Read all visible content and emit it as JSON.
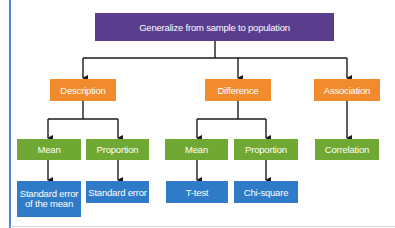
{
  "diagram": {
    "colors": {
      "root": "#5a3d8c",
      "category": "#f28a2e",
      "parameter": "#6fa832",
      "method": "#2f7bc8",
      "connector": "#1a1a1a",
      "frame_rule": "#4a86c8"
    },
    "root": {
      "label": "Generalize from sample to population"
    },
    "categories": [
      {
        "label": "Description",
        "children": [
          {
            "label": "Mean",
            "method": "Standard error of the mean"
          },
          {
            "label": "Proportion",
            "method": "Standard error"
          }
        ]
      },
      {
        "label": "Difference",
        "children": [
          {
            "label": "Mean",
            "method": "T-test"
          },
          {
            "label": "Proportion",
            "method": "Chi-square"
          }
        ]
      },
      {
        "label": "Association",
        "children": [
          {
            "label": "Correlation"
          }
        ]
      }
    ]
  }
}
